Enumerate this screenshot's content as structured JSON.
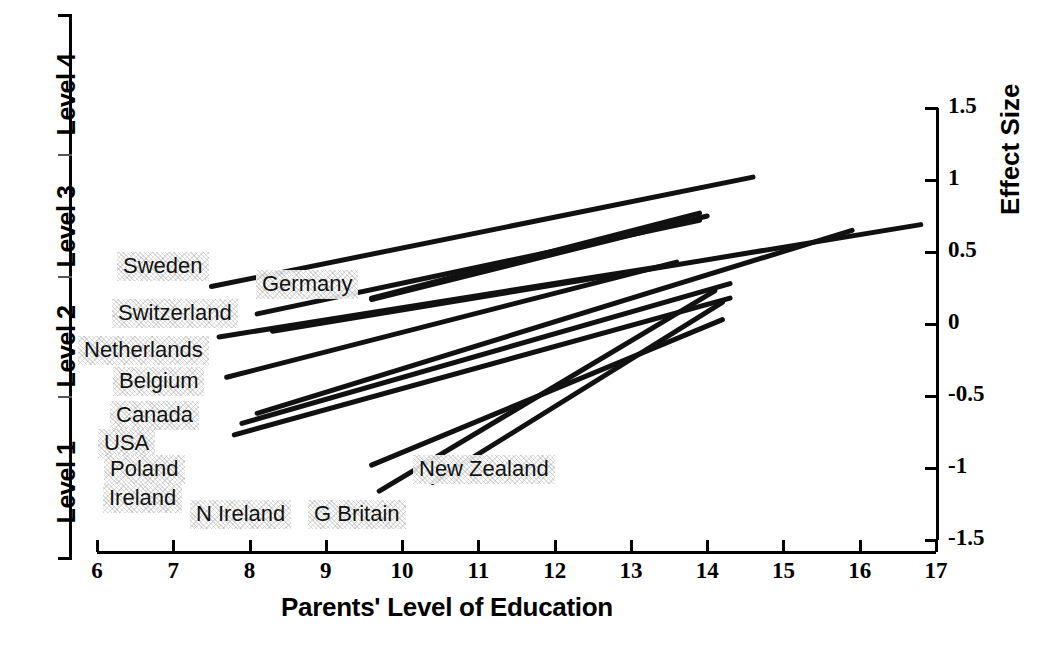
{
  "figure": {
    "title": "",
    "background": "#ffffff",
    "line_color": "#111111"
  },
  "level_axis": {
    "labels": [
      {
        "text": "Level 1",
        "top": 384,
        "height": 160
      },
      {
        "text": "Level 2",
        "top": 264,
        "height": 120
      },
      {
        "text": "Level 3",
        "top": 148,
        "height": 116
      },
      {
        "text": "Level 4",
        "top": 8,
        "height": 140
      }
    ]
  },
  "x_axis": {
    "title": "Parents' Level of Education",
    "ticks": [
      "6",
      "7",
      "8",
      "9",
      "10",
      "11",
      "12",
      "13",
      "14",
      "15",
      "16",
      "17"
    ],
    "min": 6,
    "max": 17
  },
  "y_axis": {
    "title": "Effect Size",
    "ticks": [
      "1.5",
      "1",
      "0.5",
      "0",
      "-0.5",
      "-1",
      "-1.5"
    ],
    "min": -1.5,
    "max": 1.5
  },
  "country_labels": [
    {
      "name": "Sweden",
      "text": "Sweden",
      "left": 117,
      "top": 252
    },
    {
      "name": "Germany",
      "text": "Germany",
      "left": 256,
      "top": 270
    },
    {
      "name": "Switzerland",
      "text": "Switzerland",
      "left": 112,
      "top": 299
    },
    {
      "name": "Netherlands",
      "text": "Netherlands",
      "left": 78,
      "top": 336
    },
    {
      "name": "Belgium",
      "text": "Belgium",
      "left": 113,
      "top": 367
    },
    {
      "name": "Canada",
      "text": "Canada",
      "left": 110,
      "top": 401
    },
    {
      "name": "USA",
      "text": "USA",
      "left": 98,
      "top": 429
    },
    {
      "name": "Poland",
      "text": "Poland",
      "left": 104,
      "top": 455
    },
    {
      "name": "Ireland",
      "text": "Ireland",
      "left": 103,
      "top": 484
    },
    {
      "name": "N Ireland",
      "text": "N Ireland",
      "left": 190,
      "top": 500
    },
    {
      "name": "G Britain",
      "text": "G Britain",
      "left": 308,
      "top": 500
    },
    {
      "name": "New Zealand",
      "text": "New Zealand",
      "left": 413,
      "top": 455
    }
  ],
  "chart_data": {
    "type": "line",
    "title": "",
    "xlabel": "Parents' Level of Education",
    "ylabel": "Effect Size",
    "xlim": [
      6,
      17
    ],
    "ylim": [
      -1.5,
      1.5
    ],
    "grid": false,
    "legend": "inline-annotations",
    "series": [
      {
        "name": "Sweden",
        "x": [
          7.5,
          14.6
        ],
        "y": [
          0.26,
          1.02
        ]
      },
      {
        "name": "Germany",
        "x": [
          9.6,
          13.9
        ],
        "y": [
          0.18,
          0.77
        ]
      },
      {
        "name": "Germany-b",
        "x": [
          9.6,
          14.0
        ],
        "y": [
          0.17,
          0.75
        ]
      },
      {
        "name": "Switzerland",
        "x": [
          8.1,
          13.9
        ],
        "y": [
          0.07,
          0.72
        ]
      },
      {
        "name": "Netherlands",
        "x": [
          7.6,
          13.4
        ],
        "y": [
          -0.09,
          0.4
        ]
      },
      {
        "name": "Belgium",
        "x": [
          7.7,
          13.6
        ],
        "y": [
          -0.37,
          0.43
        ]
      },
      {
        "name": "Canada",
        "x": [
          8.3,
          16.8
        ],
        "y": [
          -0.05,
          0.69
        ]
      },
      {
        "name": "USA",
        "x": [
          8.1,
          15.9
        ],
        "y": [
          -0.62,
          0.65
        ]
      },
      {
        "name": "Poland",
        "x": [
          7.9,
          14.3
        ],
        "y": [
          -0.69,
          0.28
        ]
      },
      {
        "name": "Ireland",
        "x": [
          7.8,
          14.3
        ],
        "y": [
          -0.77,
          0.18
        ]
      },
      {
        "name": "N Ireland",
        "x": [
          9.7,
          14.1
        ],
        "y": [
          -1.16,
          0.23
        ]
      },
      {
        "name": "G Britain",
        "x": [
          9.6,
          14.2
        ],
        "y": [
          -0.98,
          0.03
        ]
      },
      {
        "name": "New Zealand",
        "x": [
          10.4,
          14.2
        ],
        "y": [
          -1.1,
          0.15
        ]
      }
    ]
  }
}
